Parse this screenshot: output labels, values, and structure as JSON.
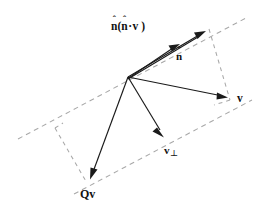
{
  "figure": {
    "background_color": "#ffffff",
    "width": 264,
    "height": 211,
    "vector_color": "#1a1a1a",
    "guide_color": "#a8a8a8",
    "label_color": "#111111"
  },
  "labels": {
    "projection": {
      "text": "n(n·v )",
      "n_first": "n",
      "hat": "ˆ",
      "open_paren": "(",
      "n_second": "n",
      "dot": "·",
      "v": "v",
      "close_paren": " )",
      "meaning": "n-hat ( n-hat dot v )"
    },
    "normal": {
      "text": "n",
      "hat": "ˆ",
      "meaning": "n-hat unit normal vector"
    },
    "vector_v": {
      "text": "v",
      "meaning": "vector v"
    },
    "vector_v_perp": {
      "text": "v",
      "subscript": "⊥",
      "meaning": "v perpendicular component"
    },
    "reflected": {
      "text": "Qv",
      "meaning": "reflected vector Q v"
    }
  },
  "geometry": {
    "origin": [
      128,
      77
    ],
    "vectors": [
      {
        "name": "projection",
        "from": [
          128,
          77
        ],
        "to": [
          206,
          31
        ]
      },
      {
        "name": "normal",
        "from": [
          128,
          77
        ],
        "to": [
          179,
          45
        ]
      },
      {
        "name": "vector_v",
        "from": [
          128,
          77
        ],
        "to": [
          227,
          97
        ]
      },
      {
        "name": "vector_v_perp",
        "from": [
          128,
          77
        ],
        "to": [
          164,
          137
        ]
      },
      {
        "name": "reflected",
        "from": [
          128,
          77
        ],
        "to": [
          90,
          179
        ]
      }
    ],
    "guides": [
      {
        "name": "plane-line",
        "from": [
          18,
          139
        ],
        "to": [
          246,
          18
        ]
      },
      {
        "name": "lower-parallel",
        "from": [
          74,
          194
        ],
        "to": [
          252,
          100
        ]
      },
      {
        "name": "proj-to-v",
        "from": [
          209,
          29
        ],
        "to": [
          229,
          99
        ]
      },
      {
        "name": "v-to-corner",
        "from": [
          229,
          99
        ],
        "to": [
          215,
          104
        ]
      },
      {
        "name": "left-corner-upper",
        "from": [
          55,
          128
        ],
        "to": [
          86,
          182
        ]
      },
      {
        "name": "left-corner-edge",
        "from": [
          55,
          128
        ],
        "to": [
          62,
          123
        ]
      }
    ]
  }
}
